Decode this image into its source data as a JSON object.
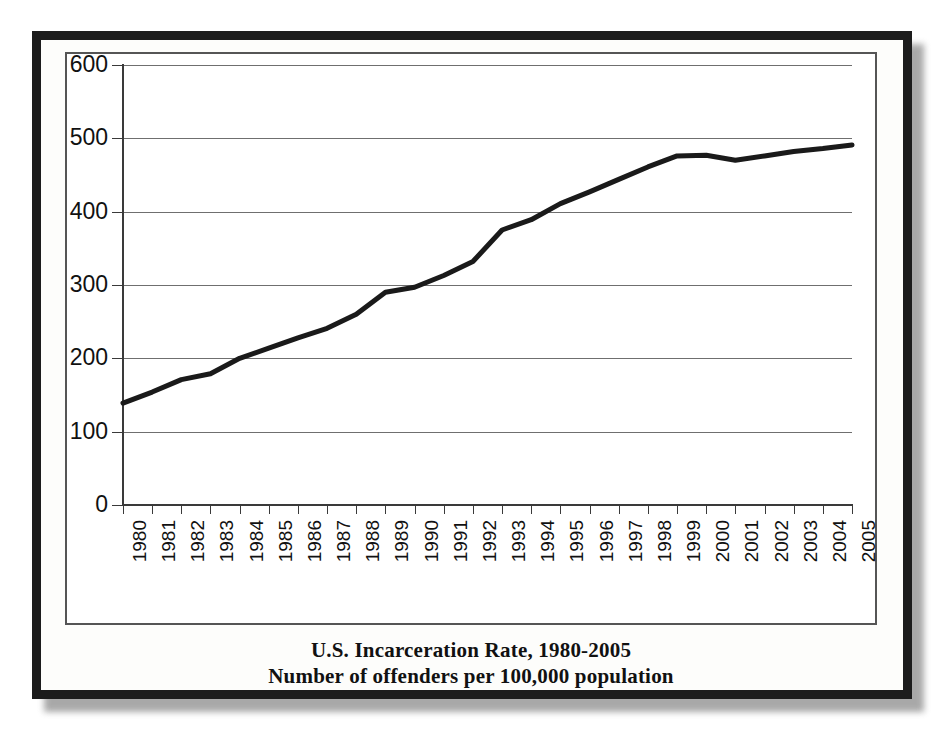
{
  "figure": {
    "caption_line1": "U.S. Incarceration Rate, 1980-2005",
    "caption_line2": "Number of offenders per 100,000 population",
    "line_color": "#1a1a1a",
    "grid_color": "#6f6f6f",
    "frame_color": "#1c1c1c"
  },
  "chart_data": {
    "type": "line",
    "title": "U.S. Incarceration Rate, 1980-2005",
    "subtitle": "Number of offenders per 100,000 population",
    "xlabel": "",
    "ylabel": "",
    "ylim": [
      0,
      600
    ],
    "ytick_labels": [
      "600",
      "500",
      "400",
      "300",
      "200",
      "100",
      "0"
    ],
    "yticks": [
      600,
      500,
      400,
      300,
      200,
      100,
      0
    ],
    "grid": true,
    "legend": false,
    "categories": [
      "1980",
      "1981",
      "1982",
      "1983",
      "1984",
      "1985",
      "1986",
      "1987",
      "1988",
      "1989",
      "1990",
      "1991",
      "1992",
      "1993",
      "1994",
      "1995",
      "1996",
      "1997",
      "1998",
      "1999",
      "2000",
      "2001",
      "2002",
      "2003",
      "2004",
      "2005"
    ],
    "x": [
      1980,
      1981,
      1982,
      1983,
      1984,
      1985,
      1986,
      1987,
      1988,
      1989,
      1990,
      1991,
      1992,
      1993,
      1994,
      1995,
      1996,
      1997,
      1998,
      1999,
      2000,
      2001,
      2002,
      2003,
      2004,
      2005
    ],
    "values": [
      139,
      154,
      171,
      179,
      200,
      214,
      228,
      241,
      260,
      290,
      297,
      313,
      332,
      375,
      389,
      411,
      427,
      444,
      461,
      476,
      477,
      470,
      476,
      482,
      486,
      491
    ],
    "series": [
      {
        "name": "U.S. incarceration rate per 100,000 population",
        "values": [
          139,
          154,
          171,
          179,
          200,
          214,
          228,
          241,
          260,
          290,
          297,
          313,
          332,
          375,
          389,
          411,
          427,
          444,
          461,
          476,
          477,
          470,
          476,
          482,
          486,
          491
        ]
      }
    ]
  }
}
